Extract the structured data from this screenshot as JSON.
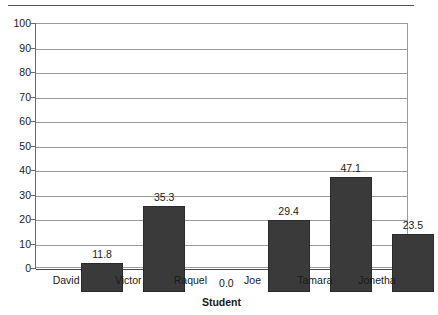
{
  "chart_data": {
    "type": "bar",
    "title": "",
    "subtitle": "",
    "xlabel": "Student",
    "ylabel": "",
    "categories": [
      "David",
      "Victor",
      "Raquel",
      "Joe",
      "Tamara",
      "Jonetha"
    ],
    "values": [
      11.8,
      35.3,
      0.0,
      29.4,
      47.1,
      23.5
    ],
    "value_labels": [
      "11.8",
      "35.3",
      "0.0",
      "29.4",
      "47.1",
      "23.5"
    ],
    "ylim": [
      0,
      100
    ],
    "ytick_step": 10,
    "ytick_labels": [
      "100",
      "90",
      "80",
      "70",
      "60",
      "50",
      "40",
      "30",
      "20",
      "10",
      "0"
    ],
    "ytick_values": [
      100,
      90,
      80,
      70,
      60,
      50,
      40,
      30,
      20,
      10,
      0
    ],
    "xtick_labels": [
      "David",
      "Victor",
      "Raquel",
      "Joe",
      "Tamara",
      "Jonetha"
    ],
    "grid": true,
    "grid_axis": "y",
    "legend": false,
    "legend_position": "none",
    "bar_color": "#3a3a3a",
    "grid_color": "#9a9a9a",
    "axis_color": "#6a6a6a",
    "background_color": "#ffffff",
    "data_labels_shown": true,
    "series": [
      {
        "name": "Score",
        "values": [
          11.8,
          35.3,
          0.0,
          29.4,
          47.1,
          23.5
        ]
      }
    ]
  },
  "figure": {
    "top_rule_present": true,
    "plot_frame_present": true
  }
}
